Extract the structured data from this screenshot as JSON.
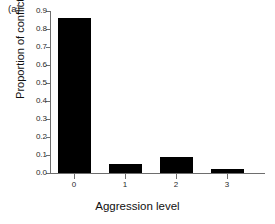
{
  "panel": {
    "label": "(a)"
  },
  "chart_data": {
    "type": "bar",
    "title": "",
    "xlabel": "Aggression level",
    "ylabel": "Proportion of conflicts",
    "categories": [
      "0",
      "1",
      "2",
      "3"
    ],
    "values": [
      0.86,
      0.05,
      0.09,
      0.02
    ],
    "ylim": [
      0.0,
      0.9
    ],
    "yticks": [
      "0.0",
      "0.1",
      "0.2",
      "0.3",
      "0.4",
      "0.5",
      "0.6",
      "0.7",
      "0.8",
      "0.9"
    ],
    "ytick_values": [
      0.0,
      0.1,
      0.2,
      0.3,
      0.4,
      0.5,
      0.6,
      0.7,
      0.8,
      0.9
    ],
    "grid": false,
    "legend": null,
    "bar_color": "#000000",
    "axis_color": "#6e6e6e"
  }
}
